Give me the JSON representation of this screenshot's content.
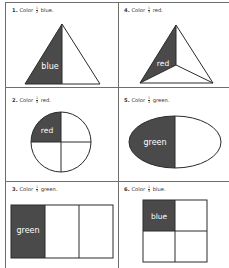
{
  "worksheet": {
    "colors": {
      "shade": "#4a4a4a",
      "outline": "#2a2a2a",
      "grid": "#6e6e6e",
      "shade_text": "#ffffff"
    },
    "items": [
      {
        "number": "1.",
        "instruction_prefix": "Color",
        "fraction": {
          "numerator": "1",
          "denominator": "2"
        },
        "color_word": "blue.",
        "shape": "triangle-halves",
        "shaded_label": "blue"
      },
      {
        "number": "4.",
        "instruction_prefix": "Color",
        "fraction": {
          "numerator": "1",
          "denominator": "3"
        },
        "color_word": "red.",
        "shape": "triangle-thirds",
        "shaded_label": "red"
      },
      {
        "number": "2.",
        "instruction_prefix": "Color",
        "fraction": {
          "numerator": "1",
          "denominator": "4"
        },
        "color_word": "red.",
        "shape": "circle-quarters",
        "shaded_label": "red"
      },
      {
        "number": "5.",
        "instruction_prefix": "Color",
        "fraction": {
          "numerator": "1",
          "denominator": "2"
        },
        "color_word": "green.",
        "shape": "ellipse-halves",
        "shaded_label": "green"
      },
      {
        "number": "3.",
        "instruction_prefix": "Color",
        "fraction": {
          "numerator": "1",
          "denominator": "3"
        },
        "color_word": "green.",
        "shape": "rectangle-thirds",
        "shaded_label": "green"
      },
      {
        "number": "6.",
        "instruction_prefix": "Color",
        "fraction": {
          "numerator": "1",
          "denominator": "4"
        },
        "color_word": "blue.",
        "shape": "square-quarters",
        "shaded_label": "blue"
      }
    ]
  }
}
